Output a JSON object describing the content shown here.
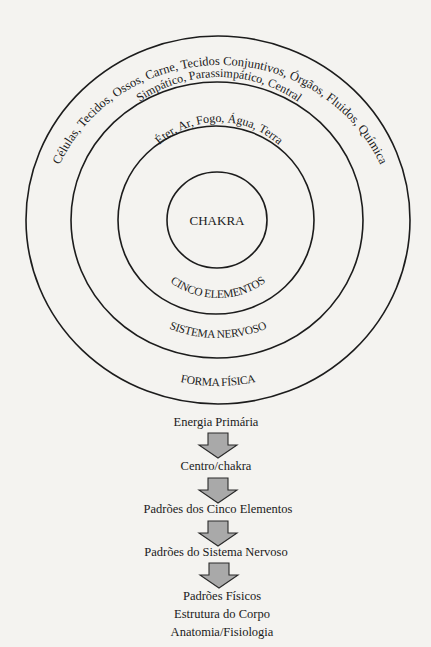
{
  "diagram": {
    "center_label": "CHAKRA",
    "rings": [
      {
        "name": "CINCO ELEMENTOS",
        "contents": "Éter, Ar, Fogo, Água, Terra"
      },
      {
        "name": "SISTEMA NERVOSO",
        "contents": "Simpático, Parassimpático, Central"
      },
      {
        "name": "FORMA FÍSICA",
        "contents": "Células, Tecidos, Ossos, Carne, Tecidos Conjuntivos, Órgãos, Fluidos, Química"
      }
    ]
  },
  "flow": {
    "steps": [
      "Energia Primária",
      "Centro/chakra",
      "Padrões dos Cinco Elementos",
      "Padrões do Sistema Nervoso"
    ],
    "final": [
      "Padrões Físicos",
      "Estrutura do Corpo",
      "Anatomia/Fisiologia"
    ],
    "arrow_color": "#a9a9a9"
  }
}
